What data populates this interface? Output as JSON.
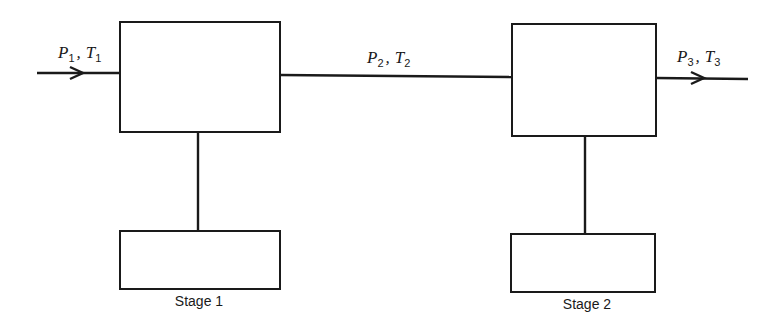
{
  "diagram": {
    "type": "two-stage process block diagram",
    "stages": [
      {
        "label": "Stage 1"
      },
      {
        "label": "Stage 2"
      }
    ],
    "streams": [
      {
        "P": "P",
        "P_sub": "1",
        "T": "T",
        "T_sub": "1",
        "sep": ",",
        "position": "inlet"
      },
      {
        "P": "P",
        "P_sub": "2",
        "T": "T",
        "T_sub": "2",
        "sep": ",",
        "position": "interstage"
      },
      {
        "P": "P",
        "P_sub": "3",
        "T": "T",
        "T_sub": "3",
        "sep": ",",
        "position": "outlet"
      }
    ],
    "colors": {
      "stroke": "#1a1a1a",
      "background": "#ffffff"
    }
  }
}
